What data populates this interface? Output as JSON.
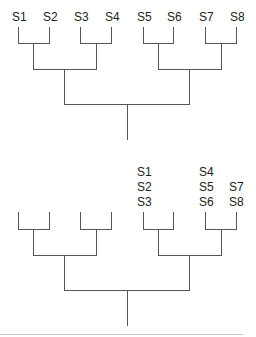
{
  "diagram": {
    "type": "dendrogram-pair",
    "colors": {
      "line": "#555555",
      "text": "#222222",
      "separator": "#c8c8c8"
    },
    "top_tree": {
      "leaf_labels": [
        "S1",
        "S2",
        "S3",
        "S4",
        "S5",
        "S6",
        "S7",
        "S8"
      ],
      "structure": "(((S1,S2),(S3,S4)),((S5,S6),(S7,S8)))"
    },
    "bottom_tree": {
      "leaf_groups": [
        {
          "leaf": 5,
          "labels": [
            "S1",
            "S2",
            "S3"
          ]
        },
        {
          "leaf": 7,
          "labels": [
            "S4",
            "S5",
            "S6"
          ]
        },
        {
          "leaf": 8,
          "labels": [
            "",
            "S7",
            "S8"
          ]
        }
      ],
      "structure": "((( , ),( , )),(( , ),( , )))"
    }
  }
}
